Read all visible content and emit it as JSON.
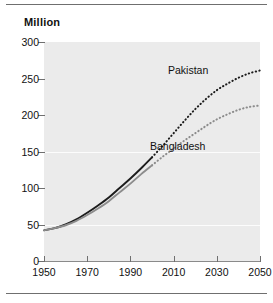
{
  "figure": {
    "top_rule": "horizontal-rule",
    "bottom_rule": "horizontal-rule"
  },
  "chart_data": {
    "type": "line",
    "title": "",
    "ylabel": "Million",
    "xlabel": "",
    "xlim": [
      1950,
      2050
    ],
    "ylim": [
      0,
      300
    ],
    "grid": "horizontal-faint-white",
    "legend_position": "inline-labels",
    "x_ticks": [
      1950,
      1970,
      1990,
      2010,
      2030,
      2050
    ],
    "y_ticks": [
      0,
      50,
      100,
      150,
      200,
      250,
      300
    ],
    "projection_starts": 2000,
    "series": [
      {
        "name": "Pakistan",
        "color": "#1c1c1c",
        "x": [
          1950,
          1955,
          1960,
          1965,
          1970,
          1975,
          1980,
          1985,
          1990,
          1995,
          2000,
          2005,
          2010,
          2015,
          2020,
          2025,
          2030,
          2035,
          2040,
          2045,
          2050
        ],
        "values": [
          42,
          45,
          50,
          57,
          66,
          76,
          87,
          100,
          113,
          127,
          142,
          158,
          175,
          192,
          208,
          222,
          234,
          243,
          251,
          257,
          261
        ]
      },
      {
        "name": "Bangladesh",
        "color": "#8c8c8c",
        "x": [
          1950,
          1955,
          1960,
          1965,
          1970,
          1975,
          1980,
          1985,
          1990,
          1995,
          2000,
          2005,
          2010,
          2015,
          2020,
          2025,
          2030,
          2035,
          2040,
          2045,
          2050
        ],
        "values": [
          42,
          45,
          49,
          55,
          63,
          72,
          82,
          94,
          106,
          119,
          131,
          143,
          154,
          165,
          175,
          185,
          194,
          201,
          207,
          211,
          213
        ]
      }
    ]
  },
  "axis": {
    "y_title": "Million",
    "y_labels": [
      "300",
      "250",
      "200",
      "150",
      "100",
      "50",
      "0"
    ],
    "x_labels": [
      "1950",
      "1970",
      "1990",
      "2010",
      "2030",
      "2050"
    ]
  },
  "labels": {
    "pakistan": "Pakistan",
    "bangladesh": "Bangladesh"
  }
}
